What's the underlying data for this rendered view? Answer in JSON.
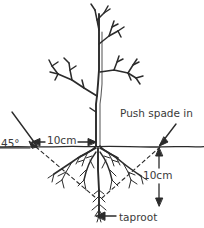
{
  "diagram": {
    "background_color": "#ffffff",
    "ink_color": "#2b2b2b",
    "text_color": "#3a3a3a",
    "labels": {
      "push_spade_in": "Push spade in",
      "angle_45": "45°",
      "horizontal_distance": "10cm",
      "vertical_depth": "10cm",
      "taproot": "taproot"
    },
    "parts": {
      "trunk": "sapling-trunk",
      "branches": "bare-branches",
      "ground_line": "ground-line",
      "roots": "root-system",
      "taproot": "taproot",
      "guide_lines": "dashed-45-degree-guides"
    },
    "measurements": [
      {
        "name": "horizontal_offset_from_trunk",
        "value": "10cm",
        "orientation": "horizontal"
      },
      {
        "name": "spade_depth",
        "value": "10cm",
        "orientation": "vertical"
      },
      {
        "name": "spade_angle",
        "value": "45°",
        "orientation": "diagonal"
      }
    ]
  }
}
